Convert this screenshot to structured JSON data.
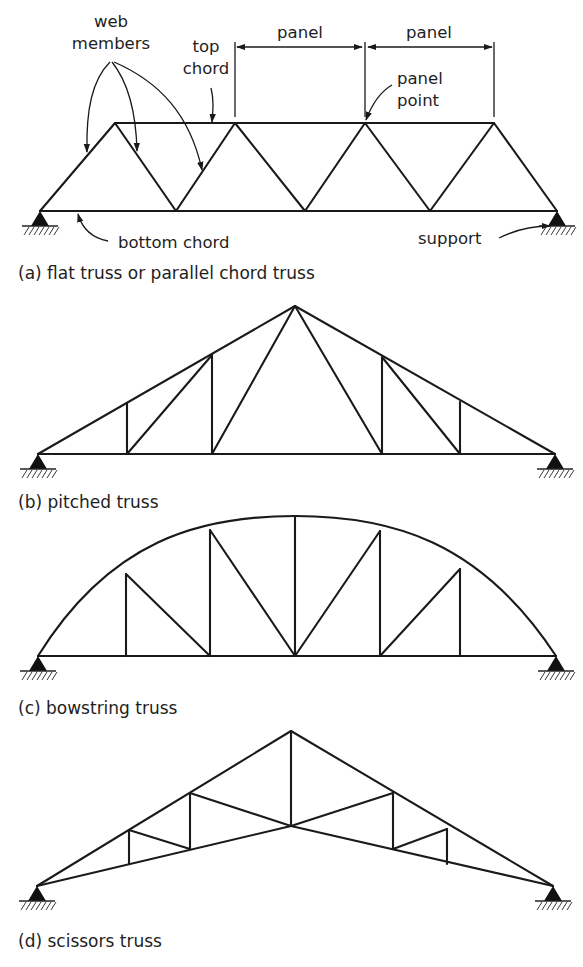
{
  "figure": {
    "width": 583,
    "height": 967,
    "colors": {
      "line": "#1a1a1a",
      "text": "#1e1e1e",
      "background": "#ffffff"
    }
  },
  "annotations": {
    "web_members": [
      "web",
      "members"
    ],
    "top_chord": [
      "top",
      "chord"
    ],
    "panel_1": "panel",
    "panel_2": "panel",
    "panel_point": [
      "panel",
      "point"
    ],
    "bottom_chord": "bottom chord",
    "support": "support"
  },
  "trusses": [
    {
      "id": "a",
      "caption": "(a) flat truss or parallel chord truss",
      "caption_pos": [
        18,
        279
      ],
      "supports": [
        [
          40,
          211
        ],
        [
          557,
          211
        ]
      ],
      "members": [
        [
          [
            40,
            211
          ],
          [
            557,
            211
          ]
        ],
        [
          [
            115,
            123
          ],
          [
            494,
            123
          ]
        ],
        [
          [
            40,
            211
          ],
          [
            115,
            123
          ]
        ],
        [
          [
            115,
            123
          ],
          [
            176,
            211
          ]
        ],
        [
          [
            176,
            211
          ],
          [
            235,
            123
          ]
        ],
        [
          [
            235,
            123
          ],
          [
            305,
            211
          ]
        ],
        [
          [
            305,
            211
          ],
          [
            365,
            123
          ]
        ],
        [
          [
            365,
            123
          ],
          [
            430,
            211
          ]
        ],
        [
          [
            430,
            211
          ],
          [
            494,
            123
          ]
        ],
        [
          [
            494,
            123
          ],
          [
            557,
            211
          ]
        ]
      ]
    },
    {
      "id": "b",
      "caption": "(b) pitched truss",
      "caption_pos": [
        18,
        508
      ],
      "supports": [
        [
          38,
          454
        ],
        [
          555,
          454
        ]
      ],
      "members": [
        [
          [
            38,
            454
          ],
          [
            555,
            454
          ]
        ],
        [
          [
            38,
            454
          ],
          [
            295,
            306
          ]
        ],
        [
          [
            295,
            306
          ],
          [
            555,
            454
          ]
        ],
        [
          [
            127,
            403
          ],
          [
            127,
            454
          ]
        ],
        [
          [
            127,
            454
          ],
          [
            212,
            355
          ]
        ],
        [
          [
            212,
            355
          ],
          [
            212,
            454
          ]
        ],
        [
          [
            212,
            454
          ],
          [
            295,
            306
          ]
        ],
        [
          [
            295,
            306
          ],
          [
            382,
            454
          ]
        ],
        [
          [
            382,
            357
          ],
          [
            382,
            454
          ]
        ],
        [
          [
            382,
            357
          ],
          [
            460,
            454
          ]
        ],
        [
          [
            460,
            402
          ],
          [
            460,
            454
          ]
        ]
      ]
    },
    {
      "id": "c",
      "caption": "(c) bowstring truss",
      "caption_pos": [
        18,
        714
      ],
      "supports": [
        [
          38,
          656
        ],
        [
          556,
          656
        ]
      ],
      "arch": {
        "start": [
          38,
          656
        ],
        "c1": [
          110,
          540
        ],
        "c2": [
          200,
          516
        ],
        "top": [
          295,
          516
        ],
        "c3": [
          390,
          516
        ],
        "c4": [
          480,
          540
        ],
        "end": [
          556,
          656
        ]
      },
      "members": [
        [
          [
            38,
            656
          ],
          [
            556,
            656
          ]
        ],
        [
          [
            126,
            574
          ],
          [
            126,
            656
          ]
        ],
        [
          [
            126,
            574
          ],
          [
            210,
            656
          ]
        ],
        [
          [
            210,
            530
          ],
          [
            210,
            656
          ]
        ],
        [
          [
            210,
            530
          ],
          [
            295,
            656
          ]
        ],
        [
          [
            295,
            516
          ],
          [
            295,
            656
          ]
        ],
        [
          [
            295,
            656
          ],
          [
            380,
            531
          ]
        ],
        [
          [
            380,
            531
          ],
          [
            380,
            656
          ]
        ],
        [
          [
            380,
            656
          ],
          [
            460,
            569
          ]
        ],
        [
          [
            460,
            569
          ],
          [
            460,
            656
          ]
        ]
      ]
    },
    {
      "id": "d",
      "caption": "(d) scissors truss",
      "caption_pos": [
        18,
        947
      ],
      "supports": [
        [
          37,
          886
        ],
        [
          553,
          886
        ]
      ],
      "members": [
        [
          [
            37,
            886
          ],
          [
            291,
            731
          ]
        ],
        [
          [
            291,
            731
          ],
          [
            553,
            886
          ]
        ],
        [
          [
            37,
            886
          ],
          [
            291,
            826
          ]
        ],
        [
          [
            291,
            826
          ],
          [
            553,
            886
          ]
        ],
        [
          [
            291,
            731
          ],
          [
            291,
            826
          ]
        ],
        [
          [
            129,
            830
          ],
          [
            129,
            864
          ]
        ],
        [
          [
            129,
            830
          ],
          [
            190,
            849
          ]
        ],
        [
          [
            190,
            793
          ],
          [
            190,
            849
          ]
        ],
        [
          [
            190,
            793
          ],
          [
            291,
            826
          ]
        ],
        [
          [
            291,
            826
          ],
          [
            393,
            793
          ]
        ],
        [
          [
            393,
            793
          ],
          [
            393,
            849
          ]
        ],
        [
          [
            393,
            849
          ],
          [
            447,
            829
          ]
        ],
        [
          [
            447,
            829
          ],
          [
            447,
            864
          ]
        ]
      ]
    }
  ]
}
